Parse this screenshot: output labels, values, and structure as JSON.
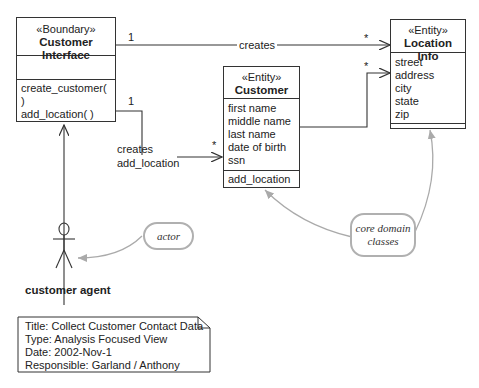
{
  "classes": {
    "customer_interface": {
      "stereotype": "«Boundary»",
      "name_line1": "Customer",
      "name_line2": "Interface",
      "operations": [
        "create_customer( )",
        "add_location( )"
      ]
    },
    "customer": {
      "stereotype": "«Entity»",
      "name": "Customer",
      "attributes": [
        "first name",
        "middle name",
        "last name",
        "date of birth",
        "ssn"
      ],
      "operations": [
        "add_location"
      ]
    },
    "location_info": {
      "stereotype": "«Entity»",
      "name": "Location Info",
      "attributes": [
        "street",
        "address",
        "city",
        "state",
        "zip"
      ]
    }
  },
  "associations": {
    "interface_to_location": {
      "label": "creates",
      "source_mult": "1",
      "target_mult": "*"
    },
    "interface_to_customer": {
      "label_line1": "creates",
      "label_line2": "add_location",
      "source_mult": "1",
      "target_mult": "*"
    },
    "customer_to_location": {
      "target_mult": "*"
    }
  },
  "actor": {
    "name": "customer agent"
  },
  "annotations": {
    "actor_note": "actor",
    "domain_note_line1": "core domain",
    "domain_note_line2": "classes"
  },
  "info_note": {
    "title": "Title: Collect Customer Contact Data",
    "type": "Type: Analysis Focused View",
    "date": "Date: 2002-Nov-1",
    "responsible": "Responsible: Garland / Anthony"
  },
  "colors": {
    "line": "#333333",
    "annotation": "#aaaaaa"
  }
}
